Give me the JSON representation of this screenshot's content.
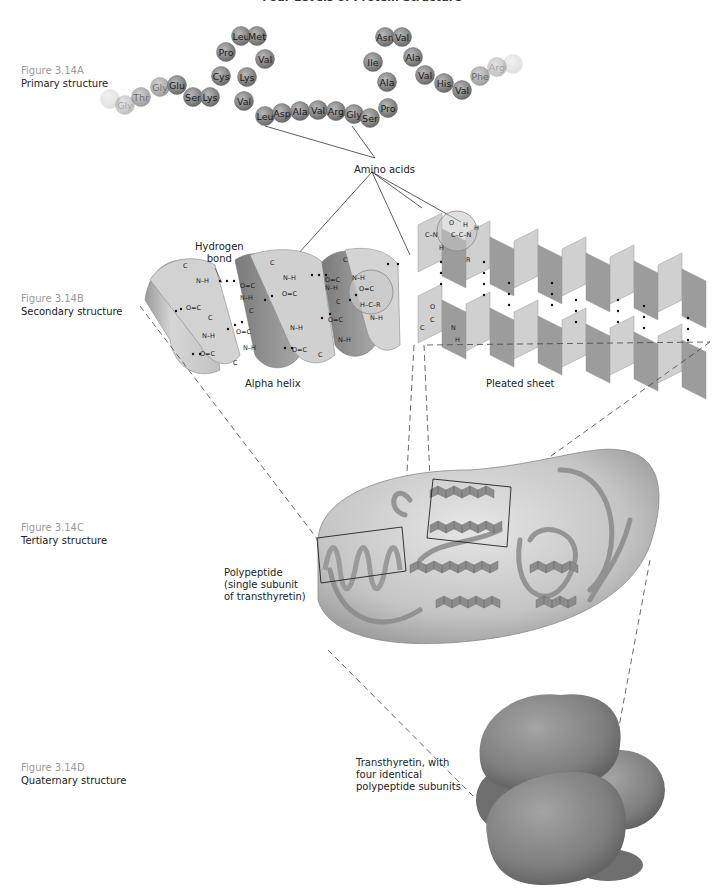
{
  "title": "Four Levels of Protein Structure",
  "figures": [
    {
      "number": "Figure 3.14A",
      "name": "Primary structure"
    },
    {
      "number": "Figure 3.14B",
      "name": "Secondary structure"
    },
    {
      "number": "Figure 3.14C",
      "name": "Tertiary structure"
    },
    {
      "number": "Figure 3.14D",
      "name": "Quaternary structure"
    }
  ],
  "primary": {
    "amino_acid_chain": [
      {
        "label": "",
        "faded": 3
      },
      {
        "label": "Gly",
        "faded": 2
      },
      {
        "label": "Thr",
        "faded": 1
      },
      {
        "label": "Gly",
        "faded": 1
      },
      {
        "label": "Glu",
        "faded": 0
      },
      {
        "label": "Ser",
        "faded": 0
      },
      {
        "label": "Lys",
        "faded": 0
      },
      {
        "label": "Cys",
        "faded": 0
      },
      {
        "label": "Pro",
        "faded": 0
      },
      {
        "label": "Leu",
        "faded": 0
      },
      {
        "label": "Met",
        "faded": 0
      },
      {
        "label": "Val",
        "faded": 0
      },
      {
        "label": "Lys",
        "faded": 0
      },
      {
        "label": "Val",
        "faded": 0
      },
      {
        "label": "Leu",
        "faded": 0
      },
      {
        "label": "Asp",
        "faded": 0
      },
      {
        "label": "Ala",
        "faded": 0
      },
      {
        "label": "Val",
        "faded": 0
      },
      {
        "label": "Arg",
        "faded": 0
      },
      {
        "label": "Gly",
        "faded": 0
      },
      {
        "label": "Ser",
        "faded": 0
      },
      {
        "label": "Pro",
        "faded": 0
      },
      {
        "label": "Ala",
        "faded": 0
      },
      {
        "label": "Ile",
        "faded": 0
      },
      {
        "label": "Asn",
        "faded": 0
      },
      {
        "label": "Val",
        "faded": 0
      },
      {
        "label": "Ala",
        "faded": 0
      },
      {
        "label": "Val",
        "faded": 0
      },
      {
        "label": "His",
        "faded": 0
      },
      {
        "label": "Val",
        "faded": 0
      },
      {
        "label": "Phe",
        "faded": 1
      },
      {
        "label": "Arg",
        "faded": 2
      },
      {
        "label": "",
        "faded": 3
      }
    ],
    "amino_acids_label": "Amino acids"
  },
  "secondary": {
    "hydrogen_bond_label": "Hydrogen\nbond",
    "alpha_helix_label": "Alpha helix",
    "pleated_sheet_label": "Pleated sheet"
  },
  "tertiary": {
    "caption": "Polypeptide\n(single subunit\nof transthyretin)"
  },
  "quaternary": {
    "caption": "Transthyretin, with\nfour  identical\npolypeptide subunits"
  },
  "colors": {
    "bead": "#8a8a8a",
    "bead_highlight": "#b5b5b5",
    "ribbon": "#c9c9c9",
    "ribbon_dark": "#8f8f8f",
    "envelope": "#bdbdbd",
    "figure_number": "#9a9a9a"
  }
}
